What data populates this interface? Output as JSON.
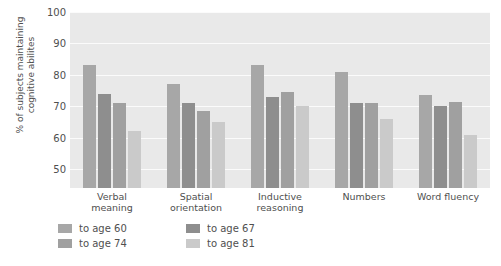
{
  "chart_data": {
    "type": "bar",
    "title": "",
    "xlabel": "",
    "ylabel": "% of subjects maintaining cognitive abilites",
    "ylabel_line1": "% of subjects maintaining",
    "ylabel_line2": "cognitive abilites",
    "ylim": [
      44,
      100
    ],
    "yticks": [
      100,
      90,
      80,
      70,
      60,
      50
    ],
    "grid": true,
    "legend_position": "bottom-left",
    "categories": [
      "Verbal meaning",
      "Spatial orientation",
      "Inductive reasoning",
      "Numbers",
      "Word fluency"
    ],
    "category_lines": [
      [
        "Verbal",
        "meaning"
      ],
      [
        "Spatial",
        "orientation"
      ],
      [
        "Inductive",
        "reasoning"
      ],
      [
        "Numbers",
        ""
      ],
      [
        "Word fluency",
        ""
      ]
    ],
    "series": [
      {
        "name": "to age 60",
        "color": "#a7a7a7",
        "values": [
          83,
          77,
          83,
          81,
          73.5
        ]
      },
      {
        "name": "to age 67",
        "color": "#8e8e8e",
        "values": [
          74,
          71,
          73,
          71,
          70
        ]
      },
      {
        "name": "to age 74",
        "color": "#a0a0a0",
        "values": [
          71,
          68.5,
          74.5,
          71,
          71.5
        ]
      },
      {
        "name": "to age 81",
        "color": "#cacaca",
        "values": [
          62,
          65,
          70,
          66,
          61
        ]
      }
    ],
    "colors": {
      "plot_background": "#e9e9e9",
      "gridline": "#fbfbfb",
      "text": "#4f4f4f",
      "page_background": "#ffffff"
    }
  }
}
